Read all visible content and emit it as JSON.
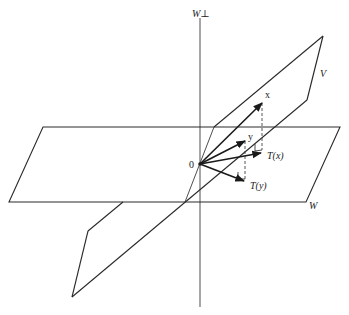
{
  "diagram": {
    "labels": {
      "w_perp": "W⊥",
      "v_plane": "V",
      "w_plane": "W",
      "origin": "0",
      "vec_x": "x",
      "vec_y": "y",
      "proj_x": "T(x)",
      "proj_y": "T(y)"
    },
    "planes": [
      {
        "name": "W",
        "corners": [
          [
            43,
            127
          ],
          [
            340,
            127
          ],
          [
            306,
            202
          ],
          [
            9,
            202
          ]
        ]
      },
      {
        "name": "V",
        "corners": [
          [
            323,
            36
          ],
          [
            307,
            100
          ],
          [
            72,
            297
          ],
          [
            88,
            231
          ]
        ]
      }
    ],
    "axis": {
      "name": "W⊥",
      "x": 200,
      "y_top": 18,
      "y_bottom": 307
    },
    "origin": [
      200,
      164
    ],
    "vectors": [
      {
        "name": "x",
        "end": [
          262,
          103
        ]
      },
      {
        "name": "y",
        "end": [
          245,
          141
        ]
      },
      {
        "name": "T(x)",
        "end": [
          261,
          153
        ]
      },
      {
        "name": "T(y)",
        "end": [
          244,
          181
        ]
      }
    ],
    "colors": {
      "stroke": "#2a2a2a",
      "background": "#ffffff"
    }
  }
}
